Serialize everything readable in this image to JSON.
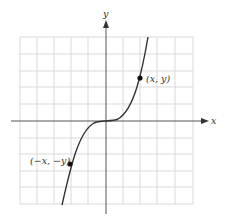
{
  "figure": {
    "type": "odd-function-graph",
    "axes": {
      "x_label": "x",
      "y_label": "y"
    },
    "grid": {
      "cols": 10,
      "rows": 10,
      "color": "#d9d9d9"
    },
    "curve": {
      "description": "odd function, cubic-like, symmetric about origin",
      "color": "#333333"
    },
    "points": [
      {
        "label": "(x, y)",
        "position": "first-quadrant"
      },
      {
        "label": "(−x, −y)",
        "position": "third-quadrant"
      }
    ]
  }
}
